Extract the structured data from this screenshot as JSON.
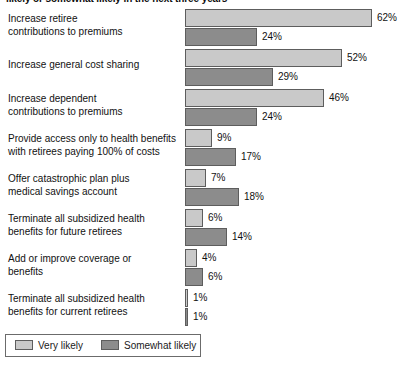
{
  "chart_data": {
    "type": "bar",
    "title": "likely or somewhat likely in the next three years",
    "xlabel": "",
    "ylabel": "",
    "xlim": [
      0,
      62
    ],
    "grid": false,
    "legend_position": "bottom-left",
    "orientation": "horizontal",
    "value_suffix": "%",
    "categories": [
      "Increase retiree contributions to premiums",
      "Increase general cost sharing",
      "Increase dependent contributions to premiums",
      "Provide access only to health benefits with retirees paying 100% of costs",
      "Offer catastrophic plan plus medical savings account",
      "Terminate all subsidized health benefits for future retirees",
      "Add or improve coverage or benefits",
      "Terminate all subsidized health benefits for current retirees"
    ],
    "series": [
      {
        "name": "Very likely",
        "color": "#c9c9c9",
        "values": [
          62,
          52,
          46,
          9,
          7,
          6,
          4,
          1
        ]
      },
      {
        "name": "Somewhat likely",
        "color": "#8c8c8c",
        "values": [
          24,
          29,
          24,
          17,
          18,
          14,
          6,
          1
        ]
      }
    ]
  },
  "rows": [
    {
      "label_lines": [
        "Increase retiree",
        "contributions to premiums"
      ],
      "very": 62,
      "very_text": "62%",
      "somewhat": 24,
      "somewhat_text": "24%"
    },
    {
      "label_lines": [
        "Increase general cost sharing"
      ],
      "very": 52,
      "very_text": "52%",
      "somewhat": 29,
      "somewhat_text": "29%"
    },
    {
      "label_lines": [
        "Increase dependent",
        "contributions to premiums"
      ],
      "very": 46,
      "very_text": "46%",
      "somewhat": 24,
      "somewhat_text": "24%"
    },
    {
      "label_lines": [
        "Provide access only to health benefits",
        "with retirees paying 100% of costs"
      ],
      "very": 9,
      "very_text": "9%",
      "somewhat": 17,
      "somewhat_text": "17%"
    },
    {
      "label_lines": [
        "Offer catastrophic plan plus",
        "medical savings account"
      ],
      "very": 7,
      "very_text": "7%",
      "somewhat": 18,
      "somewhat_text": "18%"
    },
    {
      "label_lines": [
        "Terminate all subsidized health",
        "benefits for future retirees"
      ],
      "very": 6,
      "very_text": "6%",
      "somewhat": 14,
      "somewhat_text": "14%"
    },
    {
      "label_lines": [
        "Add or improve coverage or",
        "benefits"
      ],
      "very": 4,
      "very_text": "4%",
      "somewhat": 6,
      "somewhat_text": "6%"
    },
    {
      "label_lines": [
        "Terminate all subsidized health",
        "benefits for current retirees"
      ],
      "very": 1,
      "very_text": "1%",
      "somewhat": 1,
      "somewhat_text": "1%"
    }
  ],
  "legend": {
    "items": [
      {
        "label": "Very likely",
        "color": "#c9c9c9"
      },
      {
        "label": "Somewhat likely",
        "color": "#8c8c8c"
      }
    ]
  }
}
